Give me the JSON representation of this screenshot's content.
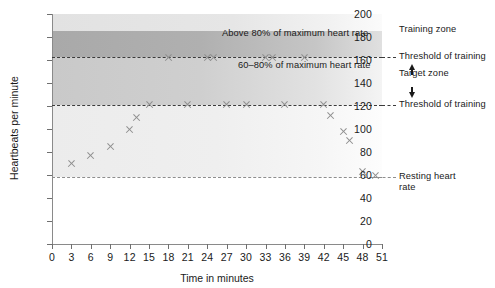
{
  "chart_data": {
    "type": "scatter",
    "title": "",
    "xlabel": "Time in minutes",
    "ylabel": "Heartbeats per minute",
    "xlim": [
      0,
      51
    ],
    "ylim": [
      0,
      200
    ],
    "xticks": [
      0,
      3,
      6,
      9,
      12,
      15,
      18,
      21,
      24,
      27,
      30,
      33,
      36,
      39,
      42,
      45,
      48,
      51
    ],
    "yticks": [
      0,
      20,
      40,
      60,
      80,
      100,
      120,
      140,
      160,
      180,
      200
    ],
    "grid": false,
    "legend": "none",
    "series": [
      {
        "name": "Heart rate",
        "marker": "x",
        "color": "#8e8e8e",
        "points": [
          {
            "x": 3,
            "y": 70
          },
          {
            "x": 6,
            "y": 77
          },
          {
            "x": 9,
            "y": 85
          },
          {
            "x": 12,
            "y": 100
          },
          {
            "x": 13,
            "y": 110
          },
          {
            "x": 15,
            "y": 121
          },
          {
            "x": 18,
            "y": 162
          },
          {
            "x": 21,
            "y": 121
          },
          {
            "x": 24,
            "y": 162
          },
          {
            "x": 25,
            "y": 162
          },
          {
            "x": 27,
            "y": 121
          },
          {
            "x": 30,
            "y": 121
          },
          {
            "x": 33,
            "y": 162
          },
          {
            "x": 34,
            "y": 162
          },
          {
            "x": 36,
            "y": 121
          },
          {
            "x": 39,
            "y": 162
          },
          {
            "x": 42,
            "y": 121
          },
          {
            "x": 43,
            "y": 112
          },
          {
            "x": 45,
            "y": 98
          },
          {
            "x": 46,
            "y": 90
          },
          {
            "x": 48,
            "y": 63
          },
          {
            "x": 50,
            "y": 60
          }
        ]
      }
    ],
    "reference_lines": [
      {
        "name": "upper-threshold",
        "y": 163,
        "style": "dashed",
        "color": "#3b3b3b",
        "label": "Threshold of training"
      },
      {
        "name": "lower-threshold",
        "y": 121,
        "style": "dashed",
        "color": "#3b3b3b",
        "label": "Threshold of training"
      },
      {
        "name": "resting-heart-rate",
        "y": 58,
        "style": "dashed",
        "color": "#8e8e8e",
        "label": "Resting heart rate"
      }
    ],
    "zones": [
      {
        "name": "training-zone",
        "label": "Above 80% of maximum heart rate",
        "from": 163,
        "to": 185
      },
      {
        "name": "target-zone",
        "label": "60–80% of maximum heart rate",
        "from": 121,
        "to": 163
      }
    ],
    "annotations": [
      {
        "name": "above-80-label",
        "text": "Above 80% of maximum heart rate"
      },
      {
        "name": "sixty-to-eighty-label",
        "text": "60–80% of maximum heart rate"
      },
      {
        "name": "training-zone-label",
        "text": "Training zone"
      },
      {
        "name": "upper-threshold-label",
        "text": "Threshold of training"
      },
      {
        "name": "target-zone-label",
        "text": "Target zone"
      },
      {
        "name": "lower-threshold-label",
        "text": "Threshold of training"
      },
      {
        "name": "resting-label",
        "text": "Resting heart rate"
      }
    ]
  }
}
